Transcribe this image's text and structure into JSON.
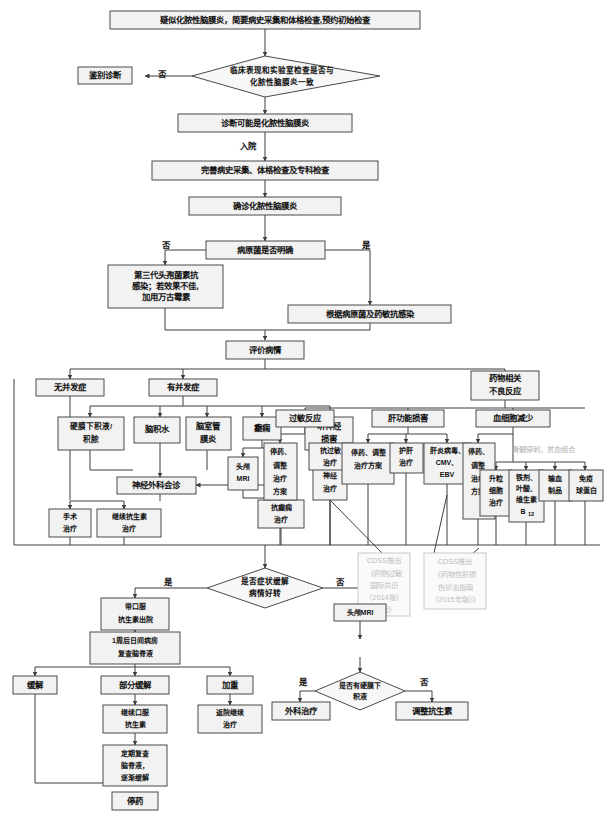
{
  "diagram": {
    "nodes": {
      "start": "疑似化脓性脑膜炎，简要病史采集和体格检查,预约初始检查",
      "d1_l1": "临床表现和实验室检查是否与",
      "d1_l2": "化脓性脑膜炎一致",
      "diff_dx": "鉴别诊断",
      "no1": "否",
      "probable": "诊断可能是化脓性脑膜炎",
      "admit": "入院",
      "workup": "完善病史采集、体格检查及专科检查",
      "confirmed": "确诊化脓性脑膜炎",
      "pathogen_q": "病原菌是否明确",
      "no2": "否",
      "yes2": "是",
      "empiric_l1": "第三代头孢菌素抗",
      "empiric_l2": "感染；若效果不佳,",
      "empiric_l3": "加用万古霉素",
      "targeted": "根据病原菌及药敏抗感染",
      "evaluate": "评价病情",
      "no_comp": "无并发症",
      "has_comp": "有并发症",
      "drug_ae_l1": "药物相关",
      "drug_ae_l2": "不良反应",
      "subdural_l1": "硬膜下积液/",
      "subdural_l2": "积脓",
      "hydroceph": "脑积水",
      "ventric_l1": "脑室管",
      "ventric_l2": "膜炎",
      "epilepsy": "癫痫",
      "acoustic_l1": "听神经",
      "acoustic_l2": "损害",
      "allergy": "过敏反应",
      "liver": "肝功能损害",
      "cytopenia": "血细胞减少",
      "mri_head_l1": "头颅",
      "mri_head_l2": "MRI",
      "eeg": "脑电图",
      "nerve_nutri": "营养神经治疗",
      "antiepileptic": "抗癫痫治疗",
      "neurosurg": "神经外科会诊",
      "surgery": "手术治疗",
      "continue_abx": "继续抗生素治疗",
      "stop_adjust_a": "停药、调整治疗方案",
      "anti_allergy": "抗过敏治疗",
      "stop_adjust_b": "停药、调整治疗方案",
      "liver_protect": "护肝治疗",
      "hepatitis_l1": "肝炎病毒、",
      "hepatitis_l2": "CMV、",
      "hepatitis_l3": "EBV",
      "stop_adjust_c": "停药、调整治疗方案",
      "gcsf": "升粒细胞治疗",
      "iron_l1": "铁剂、",
      "iron_l2": "叶酸、",
      "iron_l3": "维生素",
      "iron_l4": "B",
      "iron_sub": "12",
      "transfusion": "输血制品",
      "ivig": "免疫球蛋白",
      "marrow_note": "骨髓穿刺，贫血组合",
      "cdss1_l1": "CDSS推出",
      "cdss1_l2": "《药物过敏",
      "cdss1_l3": "国际共识",
      "cdss1_l4": "（2014版）",
      "cdss1_l5": "解读》",
      "cdss2_l1": "CDSS推出",
      "cdss2_l2": "《药物性肝损",
      "cdss2_l3": "伤诊治指南",
      "cdss2_l4": "（2015年版）》",
      "improve_q_l1": "是否症状缓解",
      "improve_q_l2": "病情好转",
      "yes3": "是",
      "no3": "否",
      "discharge_l1": "带口服",
      "discharge_l2": "抗生素出院",
      "recheck_l1": "1周后日间病房",
      "recheck_l2": "复查脑脊液",
      "remission": "缓解",
      "partial": "部分缓解",
      "worse": "加重",
      "oral_abx_l1": "继续口服",
      "oral_abx_l2": "抗生素",
      "followup_l1": "定期复查",
      "followup_l2": "脑脊液，",
      "followup_l3": "逐渐缓解",
      "stop_drug": "停药",
      "readmit_l1": "返院继续",
      "readmit_l2": "治疗",
      "mri_head2": "头颅MRI",
      "subdural_q_l1": "是否有硬膜下",
      "subdural_q_l2": "积液",
      "yes4": "是",
      "no4": "否",
      "surgical_tx": "外科治疗",
      "adjust_abx": "调整抗生素"
    },
    "colors": {
      "box_fill": "#f2f2f2",
      "box_stroke": "#4a4a4a",
      "line": "#3d3d3d",
      "ghost_text": "#bdbdbd",
      "text": "#111111"
    }
  }
}
